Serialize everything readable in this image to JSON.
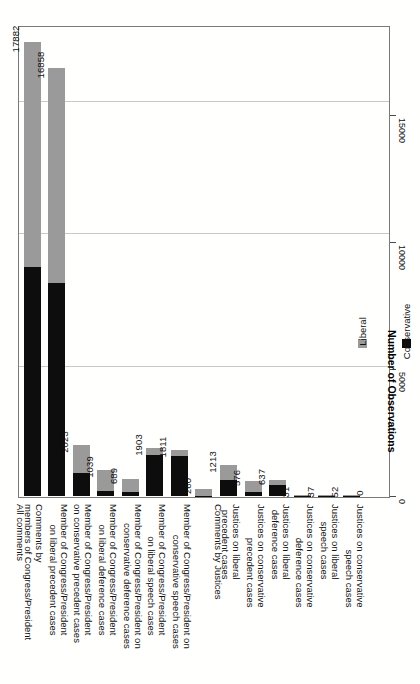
{
  "chart_data": {
    "type": "bar",
    "subtype": "stacked-bar-horizontal-rotated",
    "title": "",
    "xlabel": "",
    "ylabel": "Number of Observations",
    "ylim": [
      0,
      18500
    ],
    "yticks": [
      0,
      5000,
      10000,
      15000
    ],
    "ytick_labels": [
      "0",
      "5000",
      "10000",
      "15000"
    ],
    "grid": true,
    "legend_position": "bottom-right",
    "categories": [
      "All comments",
      "Comments by members of Congress/President",
      "Member of Congress/President on liberal precedent cases",
      "Member of Congress/President on conservative precedent cases",
      "Member of Congress/President on liberal deference cases",
      "Member of Congress/President on conservative deference cases",
      "Member of Congress/President on liberal speech cases",
      "Member of Congress/President on conservative speech cases",
      "Comments by Justices",
      "Justices on liberal precedent cases",
      "Justices on conservative precedent cases",
      "Justices on liberal deference cases",
      "Justices on conservative deference cases",
      "Justices on liberal speech cases",
      "Justices on conservative speech cases"
    ],
    "category_lines": [
      [
        "All comments",
        ""
      ],
      [
        "Comments by",
        "members of Congress/President"
      ],
      [
        "Member of Congress/President",
        "on liberal precedent cases"
      ],
      [
        "Member of Congress/President",
        "on conservative precedent cases"
      ],
      [
        "Member of Congress/President",
        "on liberal deference cases"
      ],
      [
        "Member of Congress/President on",
        "conservative deference cases"
      ],
      [
        "Member of Congress/President",
        "on liberal speech cases"
      ],
      [
        "Member of Congress/President on",
        "conservative speech cases"
      ],
      [
        "Comments by Justices",
        ""
      ],
      [
        "Justices on liberal",
        "precedent cases"
      ],
      [
        "Justices on conservative",
        "precedent cases"
      ],
      [
        "Justices on liberal",
        "deference cases"
      ],
      [
        "Justices on conservative",
        "deference cases"
      ],
      [
        "Justices on liberal",
        "speech cases"
      ],
      [
        "Justices on conservative",
        "speech cases"
      ]
    ],
    "totals": [
      17882,
      16858,
      2023,
      1039,
      689,
      1903,
      1811,
      260,
      1213,
      576,
      637,
      31,
      37,
      52,
      0
    ],
    "total_labels": [
      "17882",
      "16858",
      "2023",
      "1039",
      "689",
      "1903",
      "1811",
      "260",
      "1213",
      "576",
      "637",
      "31",
      "37",
      "52",
      "0"
    ],
    "series": [
      {
        "name": "Conservative",
        "color": "#0d0d0d",
        "values": [
          9000,
          8400,
          910,
          180,
          150,
          1620,
          1560,
          20,
          640,
          150,
          430,
          8,
          10,
          14,
          0
        ]
      },
      {
        "name": "Liberal",
        "color": "#9a9a9a",
        "values": [
          8882,
          8458,
          1113,
          859,
          539,
          283,
          251,
          240,
          573,
          426,
          207,
          23,
          27,
          38,
          0
        ]
      }
    ],
    "legend": [
      {
        "label": "Conservative",
        "color": "#0d0d0d"
      },
      {
        "label": "Liberal",
        "color": "#9a9a9a"
      }
    ]
  },
  "axis": {
    "y_title": "Number of Observations"
  }
}
